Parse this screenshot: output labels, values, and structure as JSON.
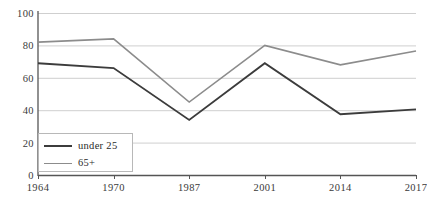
{
  "chart_data": {
    "type": "line",
    "title": "",
    "xlabel": "",
    "ylabel": "",
    "categories": [
      "1964",
      "1970",
      "1987",
      "2001",
      "2014",
      "2017"
    ],
    "x_tick_labels": [
      "1964",
      "1970",
      "1987",
      "2001",
      "2014",
      "2017"
    ],
    "y_tick_labels": [
      "0",
      "20",
      "40",
      "60",
      "80",
      "100"
    ],
    "y_ticks": [
      0,
      20,
      40,
      60,
      80,
      100
    ],
    "ylim": [
      0,
      100
    ],
    "grid": true,
    "grid_axis": "y",
    "legend_position": "bottom-left",
    "series": [
      {
        "name": "under 25",
        "color": "#3c3c3c",
        "values": [
          69,
          66,
          34,
          69,
          37.5,
          40.5
        ]
      },
      {
        "name": "65+",
        "color": "#8c8c8c",
        "values": [
          82,
          84,
          45,
          80,
          68,
          76.5
        ]
      }
    ]
  },
  "legend": {
    "items": [
      {
        "label": "under 25",
        "color": "#3c3c3c"
      },
      {
        "label": "65+",
        "color": "#8c8c8c"
      }
    ]
  },
  "colors": {
    "axis": "#555555",
    "grid": "#c9c9c9",
    "background": "#ffffff",
    "series_under_25": "#3c3c3c",
    "series_65_plus": "#8c8c8c"
  }
}
